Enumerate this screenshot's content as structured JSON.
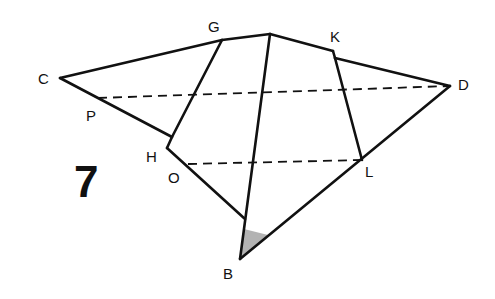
{
  "figure": {
    "number": "7",
    "stroke_color": "#111111",
    "shade_color": "#999999"
  },
  "points": {
    "C": {
      "label": "C",
      "x": 60,
      "y": 78
    },
    "G": {
      "label": "G",
      "x": 222,
      "y": 40
    },
    "T": {
      "label": "",
      "x": 270,
      "y": 34
    },
    "K": {
      "label": "K",
      "x": 333,
      "y": 51
    },
    "K2": {
      "label": "",
      "x": 335,
      "y": 58
    },
    "D": {
      "label": "D",
      "x": 450,
      "y": 86
    },
    "P": {
      "label": "P",
      "x": 98,
      "y": 98
    },
    "H": {
      "label": "H",
      "x": 167,
      "y": 148
    },
    "H1": {
      "label": "",
      "x": 172,
      "y": 137
    },
    "O": {
      "label": "O",
      "x": 188,
      "y": 164
    },
    "L": {
      "label": "L",
      "x": 362,
      "y": 160
    },
    "E": {
      "label": "",
      "x": 245,
      "y": 219
    },
    "B": {
      "label": "B",
      "x": 240,
      "y": 259
    }
  },
  "solid_segments": [
    [
      "C",
      "G"
    ],
    [
      "G",
      "T"
    ],
    [
      "T",
      "K"
    ],
    [
      "K",
      "K2"
    ],
    [
      "K2",
      "D"
    ],
    [
      "C",
      "H1"
    ],
    [
      "G",
      "H1"
    ],
    [
      "H1",
      "H"
    ],
    [
      "H",
      "E"
    ],
    [
      "T",
      "B"
    ],
    [
      "K2",
      "L"
    ],
    [
      "D",
      "B"
    ]
  ],
  "dashed_segments": [
    [
      "P",
      "D"
    ],
    [
      "O",
      "L"
    ]
  ]
}
